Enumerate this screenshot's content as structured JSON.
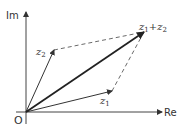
{
  "diagram": {
    "axes": {
      "x_label": "Re",
      "y_label": "Im",
      "origin_label": "O"
    },
    "vectors": [
      {
        "name": "z1",
        "label_base": "z",
        "label_sub": "1"
      },
      {
        "name": "z2",
        "label_base": "z",
        "label_sub": "2"
      },
      {
        "name": "z1+z2",
        "label_base1": "z",
        "label_sub1": "1",
        "label_op": "+",
        "label_base2": "z",
        "label_sub2": "2"
      }
    ],
    "colors": {
      "stroke": "#333333",
      "background": "#ffffff"
    }
  }
}
